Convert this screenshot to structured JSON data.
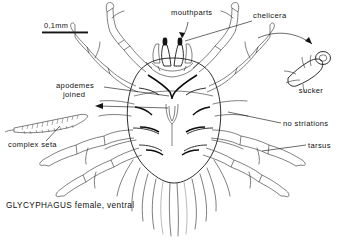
{
  "figure": {
    "organism": "GLYCYPHAGUS",
    "caption": "GLYCYPHAGUS female, ventral",
    "view": "ventral",
    "sex": "female",
    "ink_color": "#1a1a1a",
    "background_color": "#ffffff"
  },
  "scale_bar": {
    "label": "0,1mm",
    "length_px": 46,
    "represents": "0.1 mm"
  },
  "labels": [
    {
      "id": "mouthparts",
      "text": "mouthparts",
      "x": 171,
      "y": 15,
      "anchor": "start"
    },
    {
      "id": "chelicera",
      "text": "chelicera",
      "x": 253,
      "y": 18,
      "anchor": "start"
    },
    {
      "id": "sucker",
      "text": "sucker",
      "x": 311,
      "y": 93,
      "anchor": "middle"
    },
    {
      "id": "no-striations",
      "text": "no striations",
      "x": 283,
      "y": 126,
      "anchor": "start"
    },
    {
      "id": "tarsus",
      "text": "tarsus",
      "x": 308,
      "y": 148,
      "anchor": "start"
    },
    {
      "id": "apodemes",
      "text": "apodemes",
      "x": 56,
      "y": 88,
      "anchor": "start"
    },
    {
      "id": "joined",
      "text": "joined",
      "x": 63,
      "y": 97,
      "anchor": "start"
    },
    {
      "id": "complex-seta",
      "text": "complex seta",
      "x": 8,
      "y": 147,
      "anchor": "start"
    }
  ],
  "anatomy": {
    "body": "idiosoma-oval",
    "appendages": [
      "leg-I",
      "leg-II",
      "leg-III",
      "leg-IV",
      "palps",
      "chelicerae"
    ],
    "features": [
      "apodemes",
      "complex setae",
      "long posterior setae",
      "tarsal sucker",
      "genital region"
    ]
  }
}
